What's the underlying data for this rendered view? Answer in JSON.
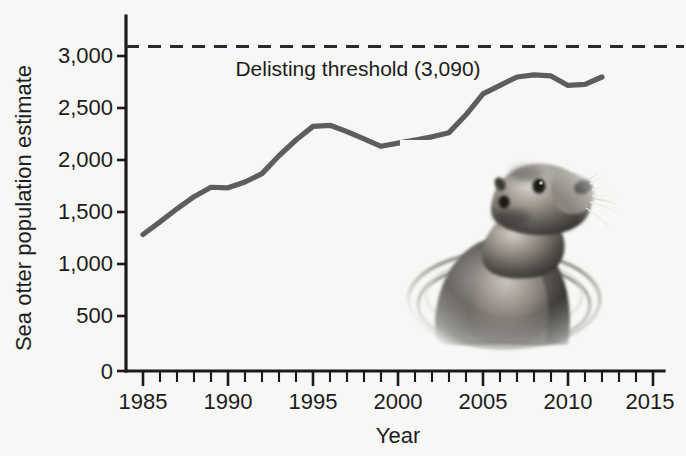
{
  "figure": {
    "background_color": "#f7f7f5",
    "text_color": "#1c1c1c"
  },
  "chart_data": {
    "type": "line",
    "title": "",
    "subtitle": "",
    "xlabel": "Year",
    "ylabel": "Sea otter population estimate",
    "xlim": [
      1984,
      2016
    ],
    "ylim": [
      0,
      3250
    ],
    "grid": false,
    "legend_position": "none",
    "x_ticks_major": [
      1985,
      1990,
      1995,
      2000,
      2005,
      2010,
      2015
    ],
    "x_tick_labels": [
      "1985",
      "1990",
      "1995",
      "2000",
      "2005",
      "2010",
      "2015"
    ],
    "x_tick_minor_step": 1,
    "y_ticks": [
      0,
      500,
      1000,
      1500,
      2000,
      2500,
      3000
    ],
    "y_tick_labels": [
      "0",
      "500",
      "1,000",
      "1,500",
      "2,000",
      "2,500",
      "3,000"
    ],
    "series": [
      {
        "name": "Sea otter population estimate",
        "color": "#5d5d5d",
        "style": "solid",
        "x": [
          1985,
          1986,
          1987,
          1988,
          1989,
          1990,
          1991,
          1992,
          1993,
          1994,
          1995,
          1996,
          1997,
          1998,
          1999,
          2000,
          2001,
          2002,
          2003,
          2004,
          2005,
          2006,
          2007,
          2008,
          2009,
          2010,
          2011,
          2012
        ],
        "values": [
          1300,
          1420,
          1545,
          1660,
          1750,
          1745,
          1800,
          1880,
          2050,
          2200,
          2330,
          2340,
          2280,
          2210,
          2140,
          2170,
          2200,
          2230,
          2270,
          2440,
          2640,
          2720,
          2800,
          2820,
          2810,
          2720,
          2730,
          2800
        ]
      }
    ],
    "annotations": [
      {
        "name": "delisting-threshold",
        "label": "Delisting threshold (3,090)",
        "value": 3090,
        "style": "dashed",
        "color": "#2a2a2a",
        "label_x": 1998.5,
        "label_y": 2930
      }
    ],
    "decoration": {
      "name": "sea-otter-photo",
      "description": "Photograph of a sea otter head emerging from water"
    }
  }
}
